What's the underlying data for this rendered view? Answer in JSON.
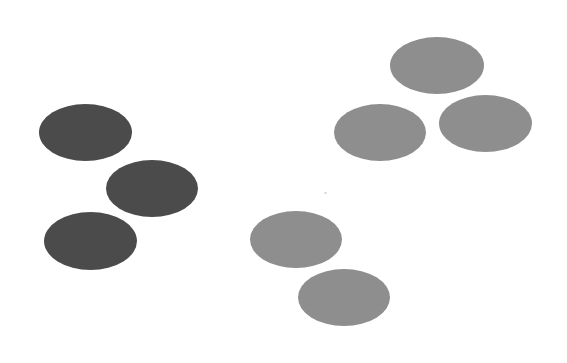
{
  "diagram": {
    "background": "#ffffff",
    "colors": {
      "dark": "#4b4b4b",
      "light": "#8e8e8e"
    },
    "groups": [
      {
        "name": "dark-cluster",
        "shape": "ellipse",
        "color": "dark",
        "count": 3,
        "items": [
          {
            "cx": 85,
            "cy": 132,
            "rx": 46,
            "ry": 28
          },
          {
            "cx": 152,
            "cy": 188,
            "rx": 46,
            "ry": 28
          },
          {
            "cx": 90,
            "cy": 241,
            "rx": 46,
            "ry": 29
          }
        ]
      },
      {
        "name": "light-cluster-top-right",
        "shape": "ellipse",
        "color": "light",
        "count": 3,
        "items": [
          {
            "cx": 437,
            "cy": 65,
            "rx": 47,
            "ry": 28
          },
          {
            "cx": 380,
            "cy": 132,
            "rx": 46,
            "ry": 28
          },
          {
            "cx": 485,
            "cy": 123,
            "rx": 47,
            "ry": 28
          }
        ]
      },
      {
        "name": "light-cluster-bottom",
        "shape": "ellipse",
        "color": "light",
        "count": 2,
        "items": [
          {
            "cx": 296,
            "cy": 239,
            "rx": 46,
            "ry": 28
          },
          {
            "cx": 344,
            "cy": 297,
            "rx": 46,
            "ry": 29
          }
        ]
      }
    ],
    "total_ellipses": 8
  }
}
